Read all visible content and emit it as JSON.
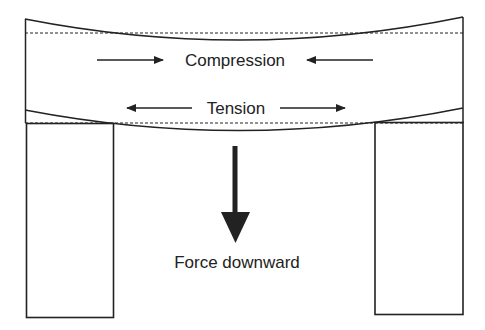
{
  "diagram": {
    "labels": {
      "compression": "Compression",
      "tension": "Tension",
      "force": "Force downward"
    },
    "colors": {
      "stroke": "#222222",
      "background": "#ffffff"
    },
    "elements": {
      "beam": "Curved beam with dashed neutral reference lines",
      "left_support": "Rectangular left pillar",
      "right_support": "Rectangular right pillar",
      "force_arrow": "Thick downward arrow"
    }
  }
}
